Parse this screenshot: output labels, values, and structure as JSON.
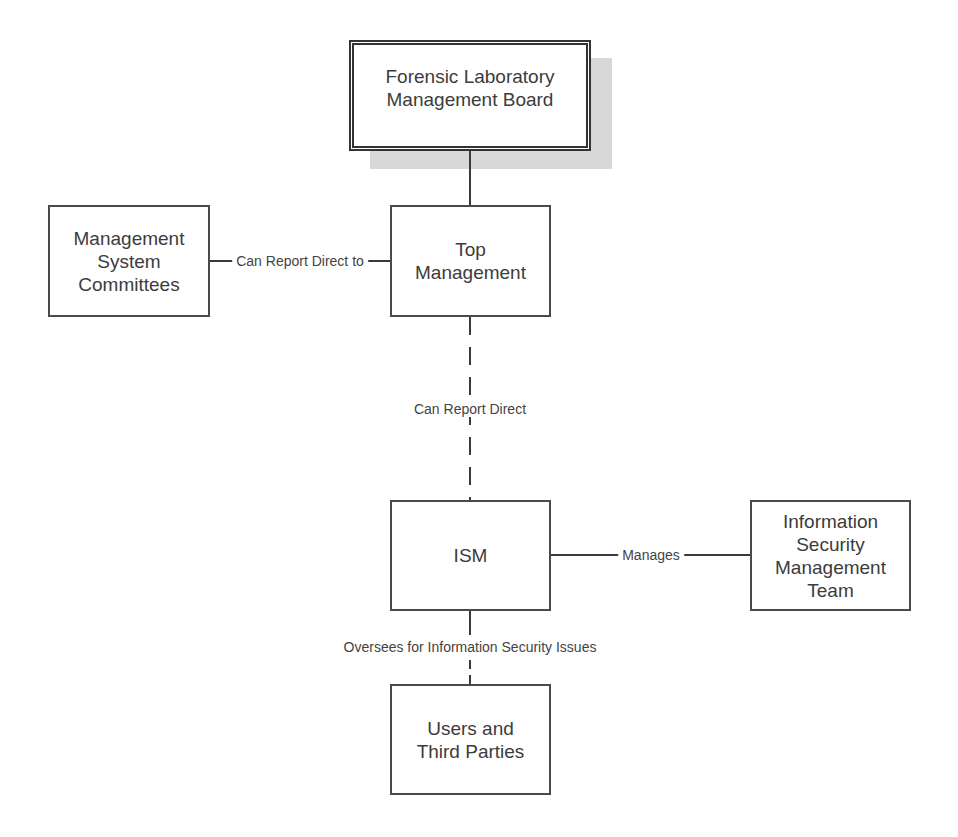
{
  "diagram": {
    "nodes": {
      "board": {
        "label": "Forensic Laboratory\nManagement Board"
      },
      "committees": {
        "label": "Management\nSystem\nCommittees"
      },
      "top_management": {
        "label": "Top\nManagement"
      },
      "ism": {
        "label": "ISM"
      },
      "ismt": {
        "label": "Information\nSecurity\nManagement\nTeam"
      },
      "users": {
        "label": "Users and\nThird Parties"
      }
    },
    "edges": {
      "committees_to_top": {
        "label": "Can Report Direct to",
        "style": "solid"
      },
      "top_to_ism": {
        "label": "Can Report Direct",
        "style": "dashed"
      },
      "ism_to_ismt": {
        "label": "Manages",
        "style": "solid"
      },
      "ism_to_users": {
        "label": "Oversees for Information Security Issues",
        "style": "solid-dashed"
      },
      "board_to_top": {
        "label": "",
        "style": "solid"
      }
    }
  }
}
